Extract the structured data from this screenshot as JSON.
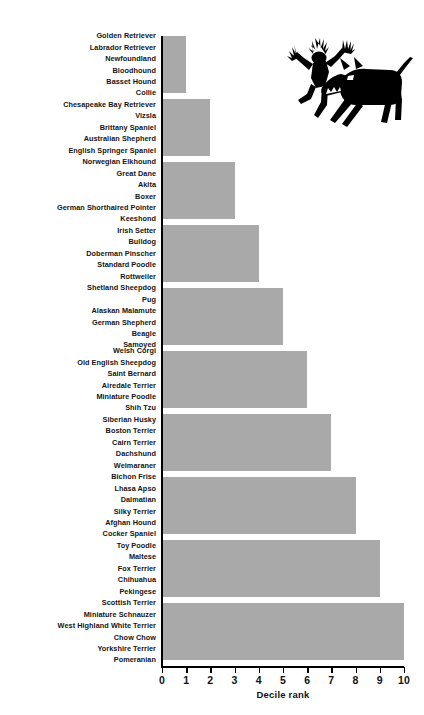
{
  "chart_data": {
    "type": "bar",
    "orientation": "horizontal",
    "title": "",
    "xlabel": "Decile rank",
    "ylabel": "",
    "xlim": [
      0,
      10
    ],
    "xticks": [
      "0",
      "1",
      "2",
      "3",
      "4",
      "5",
      "6",
      "7",
      "8",
      "9",
      "10"
    ],
    "grid": false,
    "legend": false,
    "bar_color": "#a9a9a9",
    "axis_color": "#000000",
    "categories": [
      "Golden Retriever / Labrador Retriever / Newfoundland / Bloodhound / Basset Hound / Collie",
      "Chesapeake Bay Retriever / Vizsla / Brittany Spaniel / Australian Shepherd / English Springer Spaniel",
      "Norwegian Elkhound / Great Dane / Akita / Boxer / German Shorthaired Pointer / Keeshond",
      "Irish Setter / Bulldog / Doberman Pinscher / Standard Poodle / Rottweiler",
      "Shetland Sheepdog / Pug / Alaskan Malamute / German Shepherd / Beagle / Samoyed",
      "Welsh Corgi / Old English Sheepdog / Saint Bernard / Airedale Terrier / Miniature Poodle / Shih Tzu",
      "Siberian Husky / Boston Terrier / Cairn Terrier / Dachshund / Weimaraner",
      "Bichon Frise / Lhasa Apso / Dalmatian / Silky Terrier / Afghan Hound / Cocker Spaniel",
      "Toy Poodle / Maltese / Fox Terrier / Chihuahua / Pekingese",
      "Scottish Terrier / Miniature Schnauzer / West Highland White Terrier / Chow Chow / Yorkshire Terrier / Pomeranian"
    ],
    "values": [
      1,
      2,
      3,
      4,
      5,
      6,
      7,
      8,
      9,
      10
    ]
  },
  "groups": [
    {
      "value": 1,
      "breeds": [
        "Golden Retriever",
        "Labrador Retriever",
        "Newfoundland",
        "Bloodhound",
        "Basset Hound",
        "Collie"
      ]
    },
    {
      "value": 2,
      "breeds": [
        "Chesapeake Bay Retriever",
        "Vizsla",
        "Brittany Spaniel",
        "Australian Shepherd",
        "English Springer Spaniel"
      ]
    },
    {
      "value": 3,
      "breeds": [
        "Norwegian Elkhound",
        "Great Dane",
        "Akita",
        "Boxer",
        "German Shorthaired Pointer",
        "Keeshond"
      ]
    },
    {
      "value": 4,
      "breeds": [
        "Irish Setter",
        "Bulldog",
        "Doberman Pinscher",
        "Standard Poodle",
        "Rottweiler"
      ]
    },
    {
      "value": 5,
      "breeds": [
        "Shetland Sheepdog",
        "Pug",
        "Alaskan Malamute",
        "German Shepherd",
        "Beagle",
        "Samoyed"
      ]
    },
    {
      "value": 6,
      "breeds": [
        "Welsh Corgi",
        "Old English Sheepdog",
        "Saint Bernard",
        "Airedale Terrier",
        "Miniature Poodle",
        "Shih Tzu"
      ]
    },
    {
      "value": 7,
      "breeds": [
        "Siberian Husky",
        "Boston Terrier",
        "Cairn Terrier",
        "Dachshund",
        "Weimaraner"
      ]
    },
    {
      "value": 8,
      "breeds": [
        "Bichon Frise",
        "Lhasa Apso",
        "Dalmatian",
        "Silky Terrier",
        "Afghan Hound",
        "Cocker Spaniel"
      ]
    },
    {
      "value": 9,
      "breeds": [
        "Toy Poodle",
        "Maltese",
        "Fox Terrier",
        "Chihuahua",
        "Pekingese"
      ]
    },
    {
      "value": 10,
      "breeds": [
        "Scottish Terrier",
        "Miniature Schnauzer",
        "West Highland White Terrier",
        "Chow Chow",
        "Yorkshire Terrier",
        "Pomeranian"
      ]
    }
  ],
  "axis": {
    "title": "Decile rank",
    "ticks": [
      "0",
      "1",
      "2",
      "3",
      "4",
      "5",
      "6",
      "7",
      "8",
      "9",
      "10"
    ]
  },
  "illustration": {
    "name": "person-fleeing-dog-silhouette",
    "color": "#000000"
  }
}
